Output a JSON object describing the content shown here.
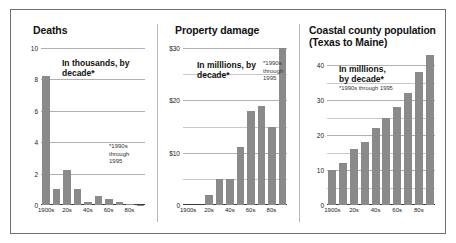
{
  "figure": {
    "border_color": "#6f6f6f",
    "bar_color": "#8a8a8a",
    "background": "#ffffff"
  },
  "chart_data": [
    {
      "type": "bar",
      "title": "Deaths",
      "subtitle": "In thousands, by\ndecade*",
      "annotation": "*1990s\nthrough\n1995",
      "xlabel": "",
      "ylabel": "",
      "categories": [
        "1900s",
        "10s",
        "20s",
        "30s",
        "40s",
        "50s",
        "60s",
        "70s",
        "80s",
        "90s"
      ],
      "tick_labels_shown": [
        "1900s",
        "20s",
        "40s",
        "60s",
        "80s"
      ],
      "values": [
        8.2,
        1.0,
        2.2,
        1.0,
        0.2,
        0.6,
        0.4,
        0.2,
        0.05,
        0.03
      ],
      "ylim": [
        0,
        10
      ],
      "yticks": [
        0,
        2,
        4,
        6,
        8,
        10
      ],
      "ytick_labels": [
        "0",
        "2",
        "4",
        "6",
        "8",
        "10"
      ],
      "grid": true,
      "legend": "none"
    },
    {
      "type": "bar",
      "title": "Property damage",
      "subtitle": "In milllions, by\ndecade*",
      "annotation": "*1990s\nthrough\n1995",
      "xlabel": "",
      "ylabel": "",
      "categories": [
        "1900s",
        "10s",
        "20s",
        "30s",
        "40s",
        "50s",
        "60s",
        "70s",
        "80s",
        "90s"
      ],
      "tick_labels_shown": [
        "1900s",
        "20s",
        "40s",
        "60s",
        "80s"
      ],
      "values": [
        0,
        0,
        2.0,
        5.0,
        5.0,
        11.0,
        18.0,
        19.0,
        15.0,
        30.0
      ],
      "ylim": [
        0,
        30
      ],
      "yticks": [
        0,
        5,
        10,
        15,
        20,
        25,
        30
      ],
      "ytick_labels": [
        "0",
        "",
        "$10",
        "",
        "$20",
        "",
        "$30"
      ],
      "grid": true,
      "legend": "none"
    },
    {
      "type": "bar",
      "title": "Coastal county population\n(Texas to Maine)",
      "subtitle": "In milllions,\nby decade*",
      "annotation": "*1990s through 1995",
      "xlabel": "",
      "ylabel": "",
      "categories": [
        "1900s",
        "10s",
        "20s",
        "30s",
        "40s",
        "50s",
        "60s",
        "70s",
        "80s",
        "90s"
      ],
      "tick_labels_shown": [
        "1900s",
        "20s",
        "40s",
        "60s",
        "80s"
      ],
      "values": [
        10,
        12,
        16,
        18,
        22,
        25,
        28,
        32,
        38,
        43
      ],
      "ylim": [
        0,
        45
      ],
      "yticks": [
        0,
        5,
        10,
        15,
        20,
        25,
        30,
        35,
        40
      ],
      "ytick_labels": [
        "0",
        "",
        "10",
        "",
        "20",
        "",
        "30",
        "",
        "40"
      ],
      "grid": true,
      "legend": "none"
    }
  ]
}
